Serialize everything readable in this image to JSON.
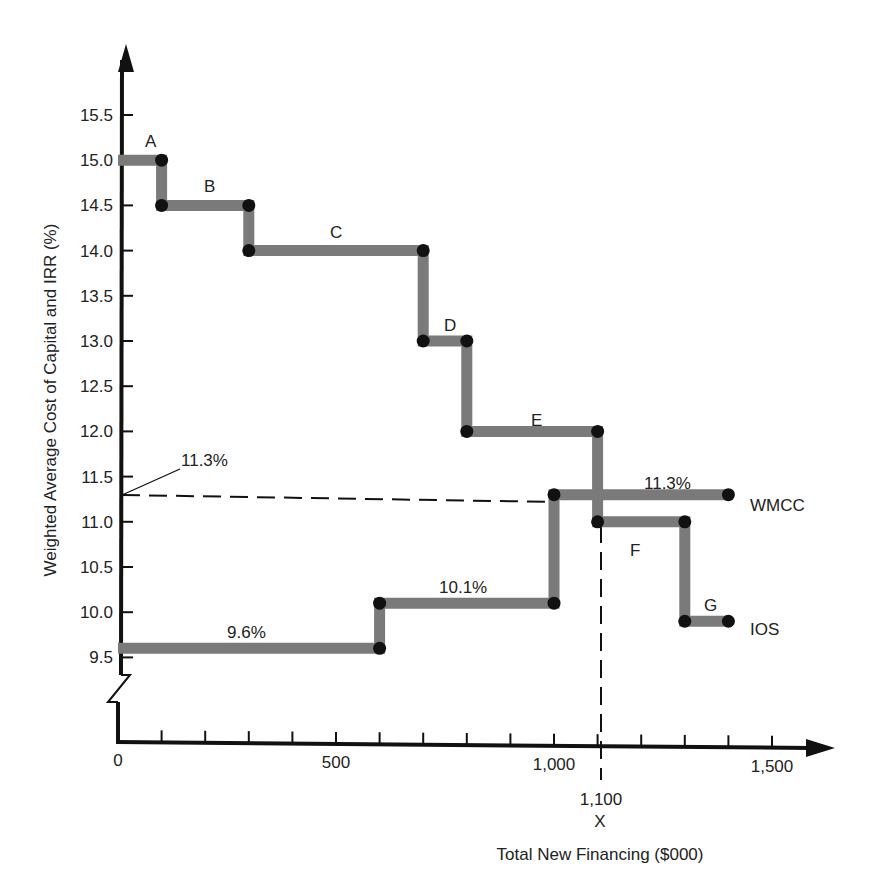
{
  "chart_data": {
    "type": "line",
    "subtype": "step",
    "title": "",
    "xlabel": "Total New Financing ($000)",
    "ylabel": "Weighted Average Cost of Capital and IRR (%)",
    "xlim": [
      0,
      1600
    ],
    "ylim": [
      9.5,
      15.5
    ],
    "x_ticks": [
      0,
      100,
      200,
      300,
      400,
      500,
      600,
      700,
      800,
      900,
      1000,
      1100,
      1200,
      1300,
      1400,
      1500
    ],
    "x_tick_labels": [
      {
        "value": 0,
        "label": "0"
      },
      {
        "value": 500,
        "label": "500"
      },
      {
        "value": 1000,
        "label": "1,000"
      },
      {
        "value": 1500,
        "label": "1,500"
      }
    ],
    "y_ticks": [
      {
        "value": 15.5,
        "label": "15.5"
      },
      {
        "value": 15.0,
        "label": "15.0"
      },
      {
        "value": 14.5,
        "label": "14.5"
      },
      {
        "value": 14.0,
        "label": "14.0"
      },
      {
        "value": 13.5,
        "label": "13.5"
      },
      {
        "value": 13.0,
        "label": "13.0"
      },
      {
        "value": 12.5,
        "label": "12.5"
      },
      {
        "value": 12.0,
        "label": "12.0"
      },
      {
        "value": 11.5,
        "label": "11.5"
      },
      {
        "value": 11.0,
        "label": "11.0"
      },
      {
        "value": 10.5,
        "label": "10.5"
      },
      {
        "value": 10.0,
        "label": "10.0"
      },
      {
        "value": 9.5,
        "label": "9.5"
      }
    ],
    "axis_break": true,
    "grid": false,
    "series": [
      {
        "name": "IOS",
        "label": "IOS",
        "steps": [
          {
            "label": "A",
            "x_start": 0,
            "x_end": 100,
            "y": 15.0
          },
          {
            "label": "B",
            "x_start": 100,
            "x_end": 300,
            "y": 14.5
          },
          {
            "label": "C",
            "x_start": 300,
            "x_end": 700,
            "y": 14.0
          },
          {
            "label": "D",
            "x_start": 700,
            "x_end": 800,
            "y": 13.0
          },
          {
            "label": "E",
            "x_start": 800,
            "x_end": 1100,
            "y": 12.0
          },
          {
            "label": "F",
            "x_start": 1100,
            "x_end": 1300,
            "y": 11.0
          },
          {
            "label": "G",
            "x_start": 1300,
            "x_end": 1400,
            "y": 9.9
          }
        ]
      },
      {
        "name": "WMCC",
        "label": "WMCC",
        "steps": [
          {
            "label": "9.6%",
            "x_start": 0,
            "x_end": 600,
            "y": 9.6
          },
          {
            "label": "10.1%",
            "x_start": 600,
            "x_end": 1000,
            "y": 10.1
          },
          {
            "label": "11.3%",
            "x_start": 1000,
            "x_end": 1400,
            "y": 11.3
          }
        ]
      }
    ],
    "annotations": [
      {
        "text": "11.3%",
        "type": "callout",
        "points_to": {
          "x": 0,
          "y": 11.3
        }
      },
      {
        "text": "1,100",
        "type": "x_marker",
        "x": 1100
      },
      {
        "text": "X",
        "type": "x_marker_symbol",
        "x": 1100
      },
      {
        "type": "dashed_line",
        "from": {
          "x": 0,
          "y": 11.3
        },
        "to": {
          "x": 1000,
          "y": 11.3
        }
      },
      {
        "type": "dashed_line",
        "from": {
          "x": 1100,
          "y": 11.0
        },
        "to": {
          "x": 1100,
          "y": "x-axis"
        }
      }
    ]
  },
  "labels": {
    "ios": "IOS",
    "wmcc": "WMCC",
    "callout_pct": "11.3%",
    "marker_value": "1,100",
    "marker_symbol": "X",
    "seg_a": "A",
    "seg_b": "B",
    "seg_c": "C",
    "seg_d": "D",
    "seg_e": "E",
    "seg_f": "F",
    "seg_g": "G",
    "w1": "9.6%",
    "w2": "10.1%",
    "w3": "11.3%",
    "xlabel": "Total New Financing ($000)",
    "ylabel": "Weighted Average Cost of Capital and IRR (%)"
  },
  "colors": {
    "step_line": "#7a7a7a",
    "dot": "#111111",
    "axis": "#111111",
    "text": "#222222"
  }
}
